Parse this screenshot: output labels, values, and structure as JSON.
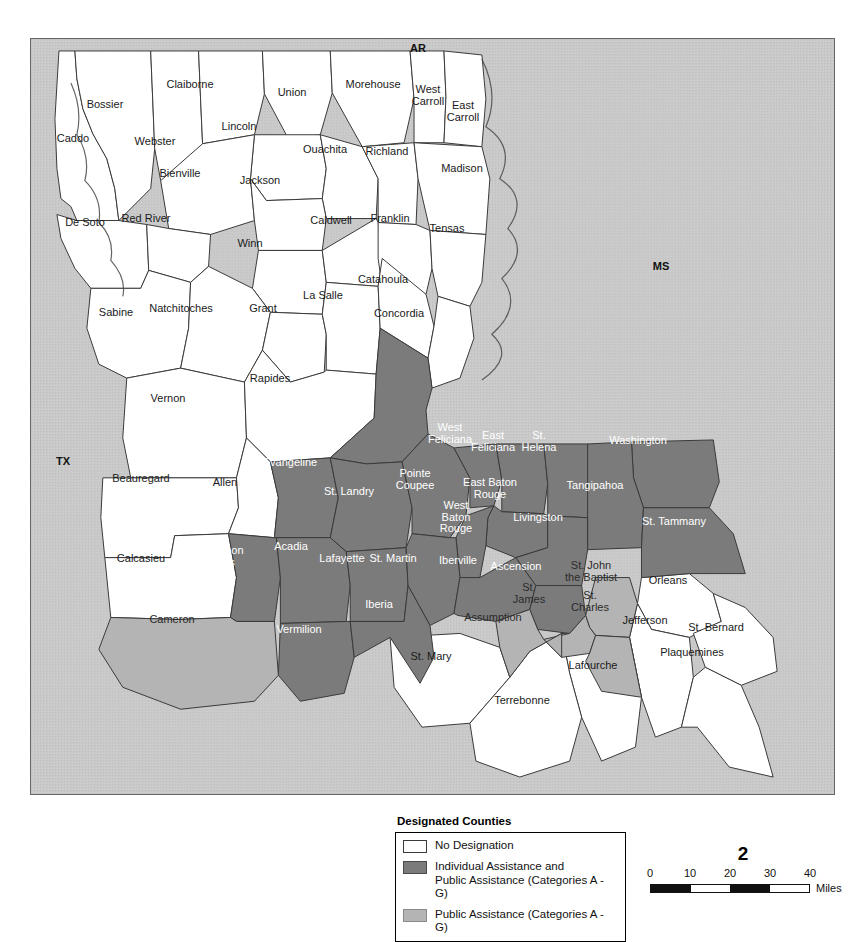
{
  "map": {
    "state_labels": [
      {
        "text": "AR",
        "x": 417,
        "y": 47
      },
      {
        "text": "MS",
        "x": 660,
        "y": 265
      },
      {
        "text": "TX",
        "x": 62,
        "y": 460
      }
    ],
    "background_color": "#c9c9c9",
    "land_no_designation_color": "#ffffff",
    "individual_and_public_assistance_color": "#7b7b7b",
    "public_assistance_color": "#b4b4b4",
    "parishes": [
      {
        "name": "Caddo",
        "label": "Caddo",
        "x": 72,
        "y": 138,
        "fill": "none"
      },
      {
        "name": "Bossier",
        "label": "Bossier",
        "x": 104,
        "y": 104,
        "fill": "none"
      },
      {
        "name": "Webster",
        "label": "Webster",
        "x": 154,
        "y": 141,
        "fill": "none"
      },
      {
        "name": "Claiborne",
        "label": "Claiborne",
        "x": 189,
        "y": 84,
        "fill": "none"
      },
      {
        "name": "Union",
        "label": "Union",
        "x": 291,
        "y": 92,
        "fill": "none"
      },
      {
        "name": "Morehouse",
        "label": "Morehouse",
        "x": 372,
        "y": 84,
        "fill": "none"
      },
      {
        "name": "West Carroll",
        "label": "West\nCarroll",
        "x": 427,
        "y": 94,
        "fill": "none"
      },
      {
        "name": "East Carroll",
        "label": "East\nCarroll",
        "x": 462,
        "y": 110,
        "fill": "none"
      },
      {
        "name": "Lincoln",
        "label": "Lincoln",
        "x": 238,
        "y": 126,
        "fill": "none"
      },
      {
        "name": "Ouachita",
        "label": "Ouachita",
        "x": 324,
        "y": 149,
        "fill": "none"
      },
      {
        "name": "Richland",
        "label": "Richland",
        "x": 386,
        "y": 151,
        "fill": "none"
      },
      {
        "name": "Madison",
        "label": "Madison",
        "x": 461,
        "y": 168,
        "fill": "none"
      },
      {
        "name": "Bienville",
        "label": "Bienville",
        "x": 179,
        "y": 173,
        "fill": "none"
      },
      {
        "name": "Jackson",
        "label": "Jackson",
        "x": 259,
        "y": 180,
        "fill": "none"
      },
      {
        "name": "De Soto",
        "label": "De Soto",
        "x": 84,
        "y": 222,
        "fill": "none"
      },
      {
        "name": "Red River",
        "label": "Red River",
        "x": 145,
        "y": 218,
        "fill": "none"
      },
      {
        "name": "Winn",
        "label": "Winn",
        "x": 249,
        "y": 243,
        "fill": "none"
      },
      {
        "name": "Caldwell",
        "label": "Caldwell",
        "x": 330,
        "y": 220,
        "fill": "none"
      },
      {
        "name": "Franklin",
        "label": "Franklin",
        "x": 389,
        "y": 218,
        "fill": "none"
      },
      {
        "name": "Tensas",
        "label": "Tensas",
        "x": 446,
        "y": 228,
        "fill": "none"
      },
      {
        "name": "Sabine",
        "label": "Sabine",
        "x": 115,
        "y": 312,
        "fill": "none"
      },
      {
        "name": "Natchitoches",
        "label": "Natchitoches",
        "x": 180,
        "y": 308,
        "fill": "none"
      },
      {
        "name": "Grant",
        "label": "Grant",
        "x": 262,
        "y": 308,
        "fill": "none"
      },
      {
        "name": "La Salle",
        "label": "La Salle",
        "x": 322,
        "y": 295,
        "fill": "none"
      },
      {
        "name": "Catahoula",
        "label": "Catahoula",
        "x": 382,
        "y": 279,
        "fill": "none"
      },
      {
        "name": "Concordia",
        "label": "Concordia",
        "x": 398,
        "y": 313,
        "fill": "none"
      },
      {
        "name": "Vernon",
        "label": "Vernon",
        "x": 167,
        "y": 398,
        "fill": "none"
      },
      {
        "name": "Rapides",
        "label": "Rapides",
        "x": 269,
        "y": 378,
        "fill": "none"
      },
      {
        "name": "Avoyelles",
        "label": "Avoyelles",
        "x": 349,
        "y": 403,
        "fill": "ia-pa"
      },
      {
        "name": "Beauregard",
        "label": "Beauregard",
        "x": 140,
        "y": 478,
        "fill": "none"
      },
      {
        "name": "Allen",
        "label": "Allen",
        "x": 224,
        "y": 482,
        "fill": "none"
      },
      {
        "name": "Evangeline",
        "label": "Evangeline",
        "x": 289,
        "y": 462,
        "fill": "ia-pa"
      },
      {
        "name": "St. Landry",
        "label": "St. Landry",
        "x": 348,
        "y": 491,
        "fill": "ia-pa"
      },
      {
        "name": "Pointe Coupee",
        "label": "Pointe\nCoupee",
        "x": 414,
        "y": 478,
        "fill": "ia-pa"
      },
      {
        "name": "West Feliciana",
        "label": "West\nFeliciana",
        "x": 449,
        "y": 432,
        "fill": "ia-pa"
      },
      {
        "name": "East Feliciana",
        "label": "East\nFeliciana",
        "x": 492,
        "y": 440,
        "fill": "ia-pa"
      },
      {
        "name": "St. Helena",
        "label": "St.\nHelena",
        "x": 538,
        "y": 440,
        "fill": "ia-pa"
      },
      {
        "name": "Washington",
        "label": "Washington",
        "x": 637,
        "y": 440,
        "fill": "ia-pa"
      },
      {
        "name": "East Baton Rouge",
        "label": "East Baton\nRouge",
        "x": 489,
        "y": 487,
        "fill": "ia-pa"
      },
      {
        "name": "West Baton Rouge",
        "label": "West\nBaton\nRouge",
        "x": 455,
        "y": 516,
        "fill": "ia-pa"
      },
      {
        "name": "Tangipahoa",
        "label": "Tangipahoa",
        "x": 594,
        "y": 485,
        "fill": "ia-pa"
      },
      {
        "name": "Livingston",
        "label": "Livingston",
        "x": 537,
        "y": 517,
        "fill": "ia-pa"
      },
      {
        "name": "St. Tammany",
        "label": "St. Tammany",
        "x": 673,
        "y": 521,
        "fill": "ia-pa"
      },
      {
        "name": "Calcasieu",
        "label": "Calcasieu",
        "x": 140,
        "y": 558,
        "fill": "none"
      },
      {
        "name": "Jefferson Davis",
        "label": "Jefferson\nDavis",
        "x": 220,
        "y": 555,
        "fill": "ia-pa"
      },
      {
        "name": "Acadia",
        "label": "Acadia",
        "x": 290,
        "y": 546,
        "fill": "ia-pa"
      },
      {
        "name": "Lafayette",
        "label": "Lafayette",
        "x": 341,
        "y": 558,
        "fill": "ia-pa"
      },
      {
        "name": "St. Martin",
        "label": "St. Martin",
        "x": 392,
        "y": 558,
        "fill": "ia-pa"
      },
      {
        "name": "Iberville",
        "label": "Iberville",
        "x": 457,
        "y": 560,
        "fill": "ia-pa"
      },
      {
        "name": "Ascension",
        "label": "Ascension",
        "x": 515,
        "y": 566,
        "fill": "ia-pa"
      },
      {
        "name": "St. John the Baptist",
        "label": "St. John\nthe Baptist",
        "x": 590,
        "y": 570,
        "fill": "pa"
      },
      {
        "name": "Orleans",
        "label": "Orleans",
        "x": 667,
        "y": 580,
        "fill": "none"
      },
      {
        "name": "St. James",
        "label": "St.\nJames",
        "x": 528,
        "y": 592,
        "fill": "pa"
      },
      {
        "name": "St. Charles",
        "label": "St.\nCharles",
        "x": 589,
        "y": 600,
        "fill": "pa"
      },
      {
        "name": "Jefferson",
        "label": "Jefferson",
        "x": 644,
        "y": 620,
        "fill": "none"
      },
      {
        "name": "St. Bernard",
        "label": "St. Bernard",
        "x": 715,
        "y": 627,
        "fill": "none"
      },
      {
        "name": "Cameron",
        "label": "Cameron",
        "x": 171,
        "y": 619,
        "fill": "pa"
      },
      {
        "name": "Vermilion",
        "label": "Vermilion",
        "x": 298,
        "y": 629,
        "fill": "ia-pa"
      },
      {
        "name": "Iberia",
        "label": "Iberia",
        "x": 378,
        "y": 604,
        "fill": "ia-pa"
      },
      {
        "name": "Assumption",
        "label": "Assumption",
        "x": 492,
        "y": 617,
        "fill": "pa"
      },
      {
        "name": "Plaquemines",
        "label": "Plaquemines",
        "x": 691,
        "y": 652,
        "fill": "none"
      },
      {
        "name": "St. Mary",
        "label": "St. Mary",
        "x": 430,
        "y": 656,
        "fill": "none"
      },
      {
        "name": "Lafourche",
        "label": "Lafourche",
        "x": 592,
        "y": 665,
        "fill": "none"
      },
      {
        "name": "Terrebonne",
        "label": "Terrebonne",
        "x": 521,
        "y": 700,
        "fill": "none"
      }
    ]
  },
  "legend": {
    "title": "Designated Counties",
    "items": [
      {
        "swatch": "none",
        "label": "No Designation"
      },
      {
        "swatch": "ia-pa",
        "label": "Individual Assistance and\nPublic Assistance (Categories A - G)"
      },
      {
        "swatch": "pa",
        "label": "Public Assistance (Categories A - G)"
      }
    ]
  },
  "scale": {
    "figure_number": "2",
    "ticks": [
      "0",
      "10",
      "20",
      "30",
      "40"
    ],
    "units": "Miles"
  }
}
